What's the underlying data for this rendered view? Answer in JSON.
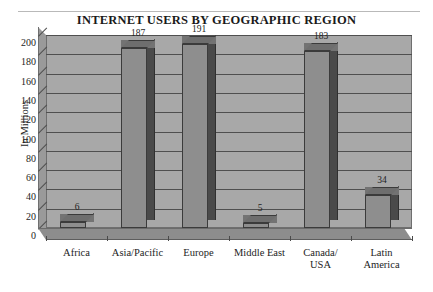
{
  "chart_data": {
    "type": "bar",
    "title": "INTERNET USERS BY GEOGRAPHIC REGION",
    "xlabel": "",
    "ylabel": "In Millions",
    "categories": [
      "Africa",
      "Asia/Pacific",
      "Europe",
      "Middle East",
      "Canada/ USA",
      "Latin America"
    ],
    "category_lines": [
      [
        "Africa"
      ],
      [
        "Asia/Pacific"
      ],
      [
        "Europe"
      ],
      [
        "Middle East"
      ],
      [
        "Canada/",
        "USA"
      ],
      [
        "Latin",
        "America"
      ]
    ],
    "values": [
      6,
      187,
      191,
      5,
      183,
      34
    ],
    "value_labels": [
      "6",
      "187",
      "191",
      "5",
      "183",
      "34"
    ],
    "ylim": [
      0,
      200
    ],
    "ytick_step": 20,
    "ytick_labels": [
      "200",
      "180",
      "160",
      "140",
      "120",
      "100",
      "80",
      "60",
      "40",
      "20",
      "0"
    ],
    "grid": true,
    "legend": false,
    "style": "3d-column",
    "colors": {
      "bar_front": "#8e8e8e",
      "bar_side": "#4a4a4a",
      "bar_top": "#6e6e6e",
      "wall": "#a8a8a8",
      "floor": "#8d8d8d",
      "gridline": "#4f4f4f",
      "text": "#1d1d1d"
    }
  }
}
